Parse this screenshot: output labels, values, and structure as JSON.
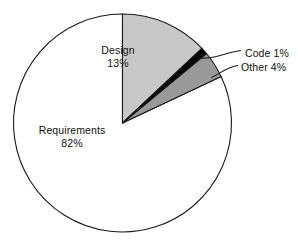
{
  "chart_data": {
    "type": "pie",
    "title": "",
    "subtitle": "",
    "xlabel": "",
    "ylabel": "",
    "grid": false,
    "legend_position": "none",
    "units": "percent",
    "total": 100,
    "start_angle_deg": 0,
    "direction": "clockwise",
    "categories": [
      "Design",
      "Code",
      "Other",
      "Requirements"
    ],
    "values": [
      13,
      1,
      4,
      82
    ],
    "slices": [
      {
        "label": "Design",
        "value": 13,
        "value_text": "13%",
        "color": "#c8c8c8",
        "label_placement": "inside",
        "start_deg": 0,
        "end_deg": 46.8
      },
      {
        "label": "Code",
        "value": 1,
        "value_text": "1%",
        "label_text": "Code 1%",
        "color": "#000000",
        "label_placement": "outside-leader",
        "start_deg": 46.8,
        "end_deg": 50.4
      },
      {
        "label": "Other",
        "value": 4,
        "value_text": "4%",
        "label_text": "Other 4%",
        "color": "#999999",
        "label_placement": "outside-leader",
        "start_deg": 50.4,
        "end_deg": 64.8
      },
      {
        "label": "Requirements",
        "value": 82,
        "value_text": "82%",
        "color": "#ffffff",
        "label_placement": "inside",
        "start_deg": 64.8,
        "end_deg": 360
      }
    ],
    "annotations": [
      {
        "name": "code-leader",
        "target": "Code",
        "text": "Code 1%"
      },
      {
        "name": "other-leader",
        "target": "Other",
        "text": "Other 4%"
      }
    ]
  },
  "geometry": {
    "center_x": 122.5,
    "center_y": 123,
    "radius": 109,
    "outline_color": "#1a1a1a",
    "background": "#ffffff"
  },
  "labels": {
    "design_name": "Design",
    "design_pct": "13%",
    "requirements_name": "Requirements",
    "requirements_pct": "82%",
    "code_full": "Code 1%",
    "other_full": "Other 4%"
  }
}
